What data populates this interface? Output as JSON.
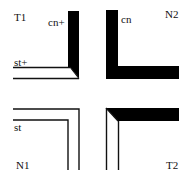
{
  "diagram": {
    "quadrants": [
      {
        "id": "T1",
        "label": "T1",
        "terminal_labels": [
          "cn+",
          "st+"
        ]
      },
      {
        "id": "N2",
        "label": "N2",
        "terminal_labels": [
          "cn"
        ]
      },
      {
        "id": "N1",
        "label": "N1",
        "terminal_labels": [
          "st"
        ]
      },
      {
        "id": "T2",
        "label": "T2",
        "terminal_labels": []
      }
    ],
    "colors": {
      "stroke": "#111111",
      "fill": "#000000",
      "background": "#ffffff"
    }
  }
}
